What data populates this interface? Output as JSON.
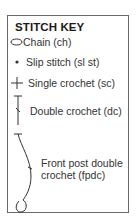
{
  "key": {
    "title": "STITCH KEY",
    "items": [
      {
        "symbol": "chain-oval-icon",
        "label": "Chain (ch)"
      },
      {
        "symbol": "slip-stitch-dot-icon",
        "label": "Slip stitch (sl st)"
      },
      {
        "symbol": "single-crochet-cross-icon",
        "label": "Single crochet (sc)"
      },
      {
        "symbol": "double-crochet-icon",
        "label": "Double crochet (dc)"
      },
      {
        "symbol": "front-post-double-crochet-icon",
        "label_line1": "Front post double",
        "label_line2": "crochet (fpdc)"
      }
    ]
  }
}
